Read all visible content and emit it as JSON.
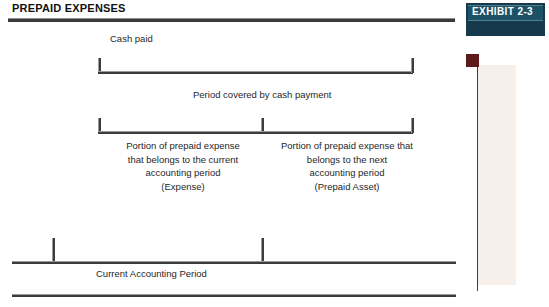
{
  "header": {
    "title": "PREPAID EXPENSES"
  },
  "badge": {
    "label": "EXHIBIT  2-3",
    "background_color": "#163a4c",
    "inner_color": "#1d5166",
    "text_color": "#ffffff"
  },
  "decoration": {
    "marker_color": "#5c1a1a",
    "rule_color": "#7d2230",
    "band_color": "#f7efe9"
  },
  "diagram": {
    "cash_paid_label": "Cash paid",
    "period_covered_label": "Period covered by cash payment",
    "expense_block": "Portion of prepaid expense\nthat belongs to the current\naccounting period\n(Expense)",
    "prepaid_asset_block": "Portion of prepaid expense that\nbelongs to the next\naccounting period\n(Prepaid Asset)",
    "current_period_label": "Current Accounting Period",
    "line_color": "#3c3c3c"
  }
}
